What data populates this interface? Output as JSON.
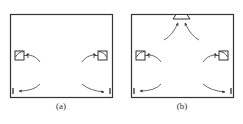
{
  "panels": [
    {
      "id": "a",
      "caption": "(a)"
    },
    {
      "id": "b",
      "caption": "(b)"
    }
  ],
  "colors": {
    "stroke": "#333333",
    "background": "#ffffff"
  }
}
